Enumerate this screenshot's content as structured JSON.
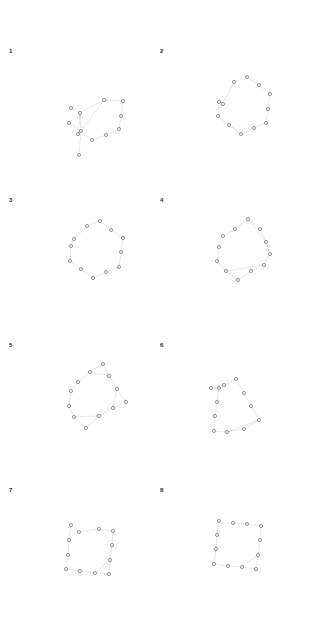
{
  "figure": {
    "colors": {
      "node_stroke": "#6a6a6a",
      "node_fill": "#f4f4f4",
      "edge": "#b9b9b9",
      "label": "#222222"
    },
    "panels": [
      {
        "label": "1",
        "label_pos": [
          9,
          54
        ],
        "nodes": [
          [
            71,
            108
          ],
          [
            80,
            113
          ],
          [
            69,
            123
          ],
          [
            81,
            131
          ],
          [
            78,
            134
          ],
          [
            79,
            155
          ],
          [
            92,
            140
          ],
          [
            106,
            135
          ],
          [
            119,
            129
          ],
          [
            121,
            116
          ],
          [
            123,
            101
          ],
          [
            104,
            100
          ]
        ],
        "edges": [
          [
            0,
            1
          ],
          [
            1,
            3
          ],
          [
            2,
            3
          ],
          [
            3,
            4
          ],
          [
            3,
            5
          ],
          [
            3,
            6
          ],
          [
            6,
            7
          ],
          [
            7,
            8
          ],
          [
            8,
            9
          ],
          [
            9,
            10
          ],
          [
            10,
            11
          ],
          [
            11,
            1
          ],
          [
            1,
            4
          ],
          [
            11,
            3
          ]
        ]
      },
      {
        "label": "2",
        "label_pos": [
          160,
          54
        ],
        "nodes": [
          [
            247,
            77
          ],
          [
            259,
            85
          ],
          [
            270,
            94
          ],
          [
            268,
            109
          ],
          [
            266,
            123
          ],
          [
            254,
            128
          ],
          [
            241,
            134
          ],
          [
            229,
            125
          ],
          [
            218,
            116
          ],
          [
            219,
            102
          ],
          [
            223,
            104
          ],
          [
            234,
            82
          ]
        ],
        "edges": [
          [
            0,
            1
          ],
          [
            1,
            2
          ],
          [
            2,
            3
          ],
          [
            3,
            4
          ],
          [
            4,
            5
          ],
          [
            5,
            6
          ],
          [
            6,
            7
          ],
          [
            7,
            8
          ],
          [
            8,
            9
          ],
          [
            9,
            10
          ],
          [
            10,
            11
          ],
          [
            11,
            0
          ]
        ]
      },
      {
        "label": "3",
        "label_pos": [
          9,
          203
        ],
        "nodes": [
          [
            100,
            221
          ],
          [
            111,
            230
          ],
          [
            123,
            238
          ],
          [
            121,
            252
          ],
          [
            119,
            267
          ],
          [
            106,
            272
          ],
          [
            93,
            278
          ],
          [
            81,
            269
          ],
          [
            70,
            261
          ],
          [
            71,
            246
          ],
          [
            74,
            239
          ],
          [
            87,
            226
          ]
        ],
        "edges": [
          [
            0,
            1
          ],
          [
            1,
            2
          ],
          [
            2,
            3
          ],
          [
            3,
            4
          ],
          [
            4,
            5
          ],
          [
            5,
            6
          ],
          [
            6,
            7
          ],
          [
            7,
            8
          ],
          [
            8,
            9
          ],
          [
            9,
            10
          ],
          [
            10,
            11
          ],
          [
            11,
            0
          ]
        ]
      },
      {
        "label": "4",
        "label_pos": [
          160,
          203
        ],
        "nodes": [
          [
            248,
            219
          ],
          [
            260,
            229
          ],
          [
            266,
            242
          ],
          [
            270,
            254
          ],
          [
            264,
            265
          ],
          [
            251,
            271
          ],
          [
            238,
            280
          ],
          [
            226,
            271
          ],
          [
            217,
            261
          ],
          [
            219,
            247
          ],
          [
            223,
            236
          ],
          [
            235,
            229
          ]
        ],
        "edges": [
          [
            0,
            1
          ],
          [
            1,
            2
          ],
          [
            2,
            3
          ],
          [
            3,
            4
          ],
          [
            4,
            5
          ],
          [
            5,
            6
          ],
          [
            6,
            7
          ],
          [
            7,
            8
          ],
          [
            8,
            9
          ],
          [
            9,
            10
          ],
          [
            10,
            11
          ],
          [
            11,
            0
          ],
          [
            0,
            2
          ],
          [
            7,
            4
          ]
        ]
      },
      {
        "label": "5",
        "label_pos": [
          9,
          348
        ],
        "nodes": [
          [
            103,
            364
          ],
          [
            109,
            376
          ],
          [
            117,
            389
          ],
          [
            126,
            402
          ],
          [
            113,
            408
          ],
          [
            99,
            416
          ],
          [
            86,
            428
          ],
          [
            74,
            417
          ],
          [
            69,
            406
          ],
          [
            71,
            391
          ],
          [
            78,
            382
          ],
          [
            90,
            372
          ]
        ],
        "edges": [
          [
            0,
            1
          ],
          [
            1,
            2
          ],
          [
            2,
            3
          ],
          [
            3,
            4
          ],
          [
            4,
            5
          ],
          [
            5,
            6
          ],
          [
            6,
            7
          ],
          [
            7,
            8
          ],
          [
            8,
            9
          ],
          [
            9,
            10
          ],
          [
            10,
            11
          ],
          [
            11,
            0
          ],
          [
            11,
            1
          ],
          [
            7,
            5
          ],
          [
            2,
            4
          ]
        ]
      },
      {
        "label": "6",
        "label_pos": [
          160,
          348
        ],
        "nodes": [
          [
            236,
            379
          ],
          [
            244,
            393
          ],
          [
            251,
            406
          ],
          [
            259,
            420
          ],
          [
            244,
            429
          ],
          [
            227,
            432
          ],
          [
            214,
            431
          ],
          [
            215,
            416
          ],
          [
            217,
            402
          ],
          [
            219,
            388
          ],
          [
            211,
            388
          ],
          [
            224,
            385
          ]
        ],
        "edges": [
          [
            0,
            1
          ],
          [
            1,
            2
          ],
          [
            2,
            3
          ],
          [
            3,
            4
          ],
          [
            4,
            5
          ],
          [
            5,
            6
          ],
          [
            6,
            7
          ],
          [
            7,
            8
          ],
          [
            8,
            9
          ],
          [
            9,
            10
          ],
          [
            10,
            11
          ],
          [
            11,
            0
          ],
          [
            3,
            5
          ]
        ]
      },
      {
        "label": "7",
        "label_pos": [
          9,
          493
        ],
        "nodes": [
          [
            71,
            525
          ],
          [
            79,
            532
          ],
          [
            99,
            529
          ],
          [
            113,
            531
          ],
          [
            112,
            545
          ],
          [
            110,
            560
          ],
          [
            109,
            574
          ],
          [
            95,
            573
          ],
          [
            80,
            571
          ],
          [
            66,
            569
          ],
          [
            68,
            555
          ],
          [
            69,
            540
          ]
        ],
        "edges": [
          [
            0,
            1
          ],
          [
            1,
            2
          ],
          [
            2,
            3
          ],
          [
            3,
            4
          ],
          [
            4,
            5
          ],
          [
            5,
            6
          ],
          [
            6,
            7
          ],
          [
            7,
            8
          ],
          [
            8,
            9
          ],
          [
            9,
            10
          ],
          [
            10,
            11
          ],
          [
            11,
            0
          ],
          [
            5,
            7
          ]
        ]
      },
      {
        "label": "8",
        "label_pos": [
          160,
          493
        ],
        "nodes": [
          [
            219,
            521
          ],
          [
            233,
            523
          ],
          [
            247,
            524
          ],
          [
            261,
            526
          ],
          [
            260,
            540
          ],
          [
            258,
            555
          ],
          [
            256,
            569
          ],
          [
            242,
            567
          ],
          [
            228,
            566
          ],
          [
            214,
            564
          ],
          [
            216,
            549
          ],
          [
            217,
            535
          ]
        ],
        "edges": [
          [
            1,
            2
          ],
          [
            2,
            3
          ],
          [
            3,
            4
          ],
          [
            4,
            5
          ],
          [
            5,
            6
          ],
          [
            6,
            7
          ],
          [
            7,
            8
          ],
          [
            8,
            9
          ],
          [
            9,
            10
          ],
          [
            10,
            11
          ],
          [
            11,
            0
          ],
          [
            5,
            7
          ]
        ]
      }
    ]
  }
}
